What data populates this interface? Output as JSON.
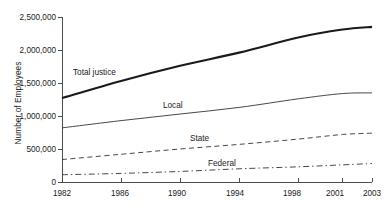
{
  "chart_data": {
    "type": "line",
    "title": "",
    "xlabel": "",
    "ylabel": "Number of Employees",
    "x": [
      1982,
      1986,
      1990,
      1994,
      1998,
      2001,
      2003
    ],
    "xtick_labels": [
      "1982",
      "1986",
      "1990",
      "1994",
      "1998",
      "2001",
      "2003"
    ],
    "ytick_labels": [
      "0",
      "500,000",
      "1,000,000",
      "1,500,000",
      "2,000,000",
      "2,500,000"
    ],
    "ytick_values": [
      0,
      500000,
      1000000,
      1500000,
      2000000,
      2500000
    ],
    "xlim": [
      1982,
      2003
    ],
    "ylim": [
      0,
      2500000
    ],
    "grid": false,
    "legend_position": "inline-labels",
    "series": [
      {
        "name": "Total justice",
        "style": "solid-thick",
        "color": "#1a1a1a",
        "values": [
          1270000,
          1530000,
          1760000,
          1960000,
          2190000,
          2310000,
          2350000
        ]
      },
      {
        "name": "Local",
        "style": "solid-thin",
        "color": "#333333",
        "values": [
          820000,
          930000,
          1030000,
          1130000,
          1260000,
          1340000,
          1350000
        ]
      },
      {
        "name": "State",
        "style": "dashed",
        "color": "#333333",
        "values": [
          340000,
          420000,
          500000,
          570000,
          650000,
          720000,
          740000
        ]
      },
      {
        "name": "Federal",
        "style": "dash-dot",
        "color": "#333333",
        "values": [
          110000,
          130000,
          160000,
          200000,
          230000,
          260000,
          280000
        ]
      }
    ],
    "annotations": [
      {
        "text": "Total justice",
        "x": 73,
        "y": 74
      },
      {
        "text": "Local",
        "x": 163,
        "y": 107
      },
      {
        "text": "State",
        "x": 190,
        "y": 140
      },
      {
        "text": "Federal",
        "x": 208,
        "y": 165
      }
    ]
  }
}
